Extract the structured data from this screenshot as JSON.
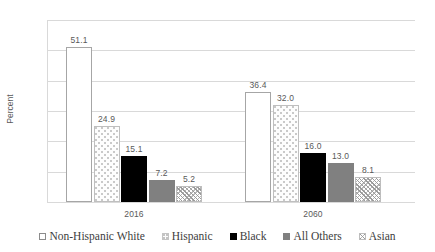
{
  "chart_data": {
    "type": "bar",
    "title": "",
    "xlabel": "",
    "ylabel": "Percent",
    "ylim": [
      0,
      60
    ],
    "ytick_labels": [
      "0.0",
      "10.0",
      "20.0",
      "30.0",
      "40.0",
      "50.0",
      "60.0"
    ],
    "ytick_values": [
      0,
      10,
      20,
      30,
      40,
      50,
      60
    ],
    "grid": true,
    "legend_position": "bottom",
    "categories": [
      "2016",
      "2060"
    ],
    "series": [
      {
        "name": "Non-Hispanic White",
        "fill": "f-white",
        "values": [
          51.1,
          36.4
        ],
        "labels": [
          "51.1",
          "36.4"
        ]
      },
      {
        "name": "Hispanic",
        "fill": "f-dots",
        "values": [
          24.9,
          32.0
        ],
        "labels": [
          "24.9",
          "32.0"
        ]
      },
      {
        "name": "Black",
        "fill": "f-black",
        "values": [
          15.1,
          16.0
        ],
        "labels": [
          "15.1",
          "16.0"
        ]
      },
      {
        "name": "All Others",
        "fill": "f-gray",
        "values": [
          7.2,
          13.0
        ],
        "labels": [
          "7.2",
          "13.0"
        ]
      },
      {
        "name": "Asian",
        "fill": "f-hatch",
        "values": [
          5.2,
          8.1
        ],
        "labels": [
          "5.2",
          "8.1"
        ]
      }
    ],
    "colors": {
      "gridline": "#d9d9d9",
      "text": "#595959",
      "black_bar": "#000000",
      "gray_bar": "#808080",
      "background": "#ffffff"
    }
  },
  "legend": {
    "items": [
      {
        "label": "Non-Hispanic White",
        "fill": "f-white"
      },
      {
        "label": "Hispanic",
        "fill": "f-dots"
      },
      {
        "label": "Black",
        "fill": "f-black"
      },
      {
        "label": "All Others",
        "fill": "f-gray"
      },
      {
        "label": "Asian",
        "fill": "f-hatch"
      }
    ]
  }
}
